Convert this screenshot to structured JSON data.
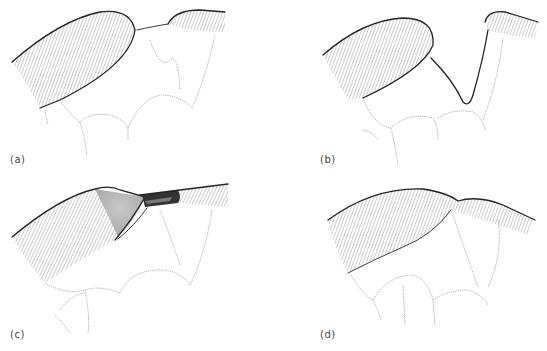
{
  "figure": {
    "panels": [
      {
        "id": "a",
        "label": "(a)",
        "description": "Large fold and small fold joined by thin bridge, lobular tissue below"
      },
      {
        "id": "b",
        "label": "(b)",
        "description": "Small fold pulled up and away, forming a V-shaped stalk"
      },
      {
        "id": "c",
        "label": "(c)",
        "description": "Grey shaded area with dark tunnel between folds"
      },
      {
        "id": "d",
        "label": "(d)",
        "description": "Folds merged into a single continuous ridge"
      }
    ],
    "colors": {
      "line": "#222222",
      "hatch": "#555555",
      "shade": "#bdbdbd",
      "dark_fill": "#333333",
      "background": "#ffffff"
    }
  }
}
